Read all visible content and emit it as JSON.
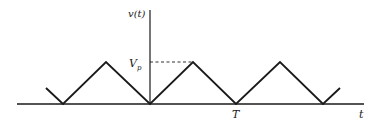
{
  "diagram": {
    "y_axis_label": "v(t)",
    "x_axis_label": "t",
    "peak_label_main": "V",
    "peak_label_sub": "p",
    "period_label": "T",
    "stroke_color": "#1a1a1a",
    "waveform": {
      "type": "triangle",
      "peak": "Vp",
      "min": 0,
      "period": "T",
      "troughs_at": [
        "-T",
        "0",
        "T",
        "2T"
      ],
      "peaks_at": [
        "-T/2",
        "T/2",
        "3T/2"
      ]
    }
  }
}
